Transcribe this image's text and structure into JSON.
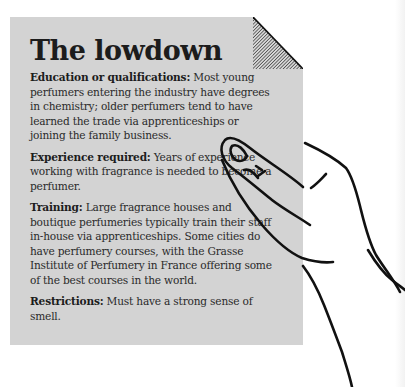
{
  "panel": {
    "title": "The lowdown",
    "items": [
      {
        "label": "Education or qualifications:",
        "text": " Most young perfumers entering the industry have degrees in chemistry; older perfumers tend to have learned the trade via apprenticeships or joining the family business."
      },
      {
        "label": "Experience required:",
        "text": " Years of experience working with fragrance is needed to become a perfumer."
      },
      {
        "label": "Training:",
        "text": " Large fragrance houses and boutique perfumeries typically train their staff in-house via apprenticeships. Some cities do have perfumery courses, with the Grasse Institute of Perfumery in France offering some of the best courses in the world."
      },
      {
        "label": "Restrictions:",
        "text": " Must have a strong sense of smell."
      }
    ]
  },
  "colors": {
    "card": "#d3d3d3",
    "text": "#2a2a2a",
    "outline": "#111111"
  },
  "icons": {
    "fold": "folded-corner-icon",
    "hand": "pointing-hand-icon"
  }
}
